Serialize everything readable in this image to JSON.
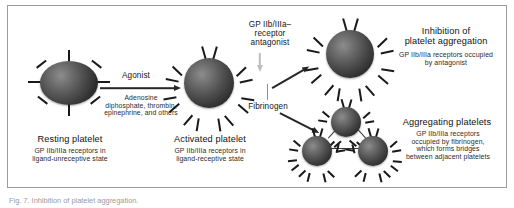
{
  "figure": {
    "panel_border_color": "#9b9b9b",
    "background": "#ffffff"
  },
  "labels": {
    "agonist": "Agonist",
    "agonist_list": "Adenosine\ndiphosphate, thrombin,\nepinephrine, and others",
    "resting_title": "Resting platelet",
    "resting_sub": "GP IIb/IIIa receptors in\nligand-unreceptive state",
    "activated_title": "Activated platelet",
    "activated_sub": "GP IIb/IIIa receptors in\nligand-receptive state",
    "antagonist": "GP IIb/IIIa–\nreceptor\nantagonist",
    "fibrinogen": "Fibrinogen",
    "inhibition_title": "Inhibition of\nplatelet aggregation",
    "inhibition_sub": "GP IIb/IIIa receptors occupied\nby antagonist",
    "aggregating_title": "Aggregating platelets",
    "aggregating_sub": "GP IIb/IIIa receptors\noccupied by fibrinogen,\nwhich forms bridges\nbetween adjacent platelets"
  },
  "caption": {
    "text": "Fig. 7. Inhibition of platelet aggregation."
  },
  "platelets": {
    "resting": {
      "shape": "ellipse",
      "receptor_style": "bar"
    },
    "activated": {
      "shape": "circle",
      "receptor_style": "forked"
    },
    "inhibited": {
      "shape": "circle",
      "receptor_style": "forked"
    },
    "aggregating_count": 3
  }
}
